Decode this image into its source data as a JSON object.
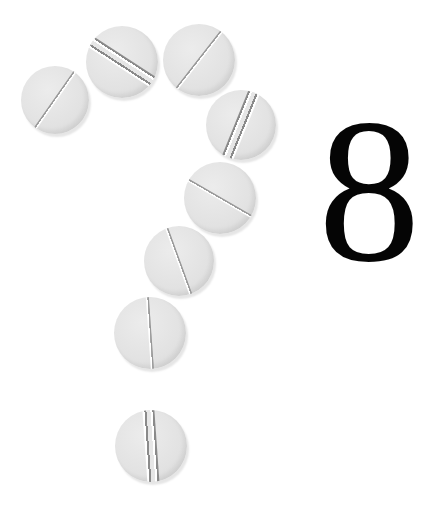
{
  "image": {
    "description": "White tablets arranged in the shape of a question mark next to a large serif number",
    "background_color": "#ffffff",
    "pill_color": "#e2e2e2",
    "number_color": "#050505"
  },
  "number": {
    "text": "8"
  },
  "pills": [
    {
      "id": 1,
      "cx": 55,
      "cy": 100,
      "d": 68,
      "angle": -55,
      "score": "single"
    },
    {
      "id": 2,
      "cx": 122,
      "cy": 62,
      "d": 72,
      "angle": 33,
      "score": "double"
    },
    {
      "id": 3,
      "cx": 199,
      "cy": 60,
      "d": 72,
      "angle": -52,
      "score": "single"
    },
    {
      "id": 4,
      "cx": 241,
      "cy": 125,
      "d": 70,
      "angle": -68,
      "score": "double"
    },
    {
      "id": 5,
      "cx": 220,
      "cy": 198,
      "d": 72,
      "angle": 30,
      "score": "single"
    },
    {
      "id": 6,
      "cx": 179,
      "cy": 261,
      "d": 70,
      "angle": 70,
      "score": "single"
    },
    {
      "id": 7,
      "cx": 150,
      "cy": 333,
      "d": 72,
      "angle": 86,
      "score": "single"
    },
    {
      "id": 8,
      "cx": 151,
      "cy": 446,
      "d": 72,
      "angle": 86,
      "score": "double"
    }
  ]
}
